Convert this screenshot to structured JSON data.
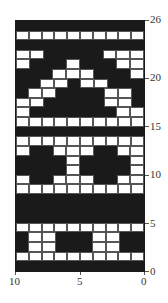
{
  "chart_data": {
    "type": "heatmap",
    "title": "",
    "columns": 10,
    "rows_count": 26,
    "colors": {
      "B": "#1a1a1a",
      "W": "#ffffff"
    },
    "rows": [
      {
        "row": 26,
        "pattern": "BBBBBBBBBB"
      },
      {
        "row": 25,
        "pattern": "WWWWWWWWWW"
      },
      {
        "row": 24,
        "pattern": "BBBBBBBBBB"
      },
      {
        "row": 23,
        "pattern": "WWBBBBBWWW"
      },
      {
        "row": 22,
        "pattern": "WBBBWBBBWW"
      },
      {
        "row": 21,
        "pattern": "BBBWWWBBBW"
      },
      {
        "row": 20,
        "pattern": "BBWWBWWBBB"
      },
      {
        "row": 19,
        "pattern": "BWWBBBBWWB"
      },
      {
        "row": 18,
        "pattern": "WWBBBBBWWB"
      },
      {
        "row": 17,
        "pattern": "WBBBBBBBWW"
      },
      {
        "row": 16,
        "pattern": "WWWWWWWWWW"
      },
      {
        "row": 15,
        "pattern": "BBBBBBBBBB"
      },
      {
        "row": 14,
        "pattern": "WWWWWWWWWW"
      },
      {
        "row": 13,
        "pattern": "WBBWWWBBWW"
      },
      {
        "row": 12,
        "pattern": "BBBBWBBBBW"
      },
      {
        "row": 11,
        "pattern": "BBBBWBBBBW"
      },
      {
        "row": 10,
        "pattern": "WBBWWWBBWW"
      },
      {
        "row": 9,
        "pattern": "WWWWWWWWWW"
      },
      {
        "row": 8,
        "pattern": "BBBBBBBBBB"
      },
      {
        "row": 7,
        "pattern": "BBBBBBBBBB"
      },
      {
        "row": 6,
        "pattern": "BBBBBBBBBB"
      },
      {
        "row": 5,
        "pattern": "WWWWWWWWWW"
      },
      {
        "row": 4,
        "pattern": "BWWBBBWWBB"
      },
      {
        "row": 3,
        "pattern": "BWWBBBWWBB"
      },
      {
        "row": 2,
        "pattern": "WWWWWWWWWW"
      },
      {
        "row": 1,
        "pattern": "BBBBBBBBBB"
      }
    ],
    "y_axis": {
      "position": "right",
      "ticks": [
        26,
        20,
        15,
        10,
        5,
        0
      ],
      "range": [
        0,
        26
      ]
    },
    "x_axis": {
      "position": "bottom",
      "ticks": [
        10,
        5,
        0
      ],
      "range": [
        10,
        0
      ]
    }
  },
  "axis": {
    "y_labels": [
      "26",
      "20",
      "15",
      "10",
      "5",
      "0"
    ],
    "x_labels": [
      "10",
      "5",
      "0"
    ]
  }
}
